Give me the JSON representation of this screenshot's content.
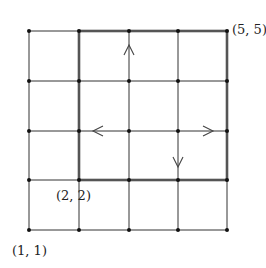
{
  "diagram": {
    "type": "grid-lattice",
    "grid": {
      "cols": 5,
      "rows": 5,
      "x_positions": [
        29,
        79,
        129,
        178,
        227
      ],
      "y_positions": [
        230,
        180,
        131,
        81,
        31
      ]
    },
    "highlighted_square": {
      "from": [
        2,
        2
      ],
      "to": [
        5,
        5
      ]
    },
    "labels": {
      "top_right": "(5, 5)",
      "inner_corner": "(2, 2)",
      "origin": "(1, 1)"
    },
    "arrows": [
      {
        "at": [
          3,
          4.5
        ],
        "direction": "up"
      },
      {
        "at": [
          2.3,
          3
        ],
        "direction": "left"
      },
      {
        "at": [
          4.7,
          3
        ],
        "direction": "right"
      },
      {
        "at": [
          4,
          2.5
        ],
        "direction": "down"
      }
    ],
    "colors": {
      "line": "#333333",
      "thick_line": "#555555",
      "dot": "#111111"
    }
  }
}
